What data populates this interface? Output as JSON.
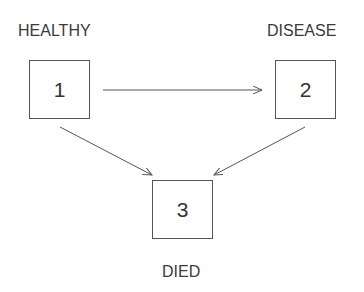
{
  "diagram": {
    "type": "state-transition",
    "states": [
      {
        "id": "1",
        "number": "1",
        "label": "HEALTHY"
      },
      {
        "id": "2",
        "number": "2",
        "label": "DISEASE"
      },
      {
        "id": "3",
        "number": "3",
        "label": "DIED"
      }
    ],
    "transitions": [
      {
        "from": "1",
        "to": "2"
      },
      {
        "from": "1",
        "to": "3"
      },
      {
        "from": "2",
        "to": "3"
      }
    ],
    "colors": {
      "line": "#555555",
      "text": "#333333",
      "background": "#ffffff"
    }
  }
}
